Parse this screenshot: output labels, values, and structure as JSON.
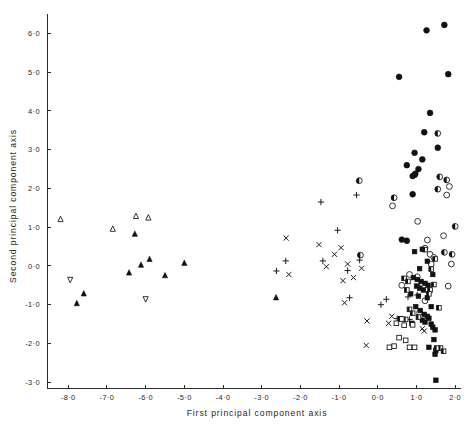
{
  "figure": {
    "title": "",
    "background_color": "#ffffff",
    "ink_color": "#111111"
  },
  "axes": {
    "x_title": "First principal component axis",
    "y_title": "Second principal component axis",
    "x_ticks": [
      "-8·0",
      "-7·0",
      "-6·0",
      "-5·0",
      "-4·0",
      "-3·0",
      "-2·0",
      "-1·0",
      "0·0",
      "1·0",
      "2·0"
    ],
    "y_ticks": [
      "6·0",
      "5·0",
      "4·0",
      "3·0",
      "2·0",
      "1·0",
      "0·0",
      "-1·0",
      "-2·0",
      "-3·0"
    ]
  },
  "chart_data": {
    "type": "scatter",
    "title": "",
    "xlabel": "First principal component axis",
    "ylabel": "Second principal component axis",
    "xlim": [
      -8.55,
      2.15
    ],
    "ylim": [
      -3.15,
      6.45
    ],
    "xticks": [
      -8,
      -7,
      -6,
      -5,
      -4,
      -3,
      -2,
      -1,
      0,
      1,
      2
    ],
    "yticks": [
      6,
      5,
      4,
      3,
      2,
      1,
      0,
      -1,
      -2,
      -3
    ],
    "grid": false,
    "legend_position": "none",
    "series": [
      {
        "name": "open-triangle-up",
        "marker": "triangle-up-open",
        "points": [
          [
            -8.2,
            1.2
          ],
          [
            -6.85,
            0.95
          ],
          [
            -6.25,
            1.28
          ],
          [
            -5.93,
            1.24
          ]
        ]
      },
      {
        "name": "filled-triangle-up",
        "marker": "triangle-up-filled",
        "points": [
          [
            -7.78,
            -0.97
          ],
          [
            -7.6,
            -0.72
          ],
          [
            -6.28,
            0.82
          ],
          [
            -6.43,
            -0.18
          ],
          [
            -6.12,
            0.02
          ],
          [
            -5.9,
            0.17
          ],
          [
            -5.5,
            -0.25
          ],
          [
            -5.0,
            0.07
          ],
          [
            -2.63,
            -0.82
          ]
        ]
      },
      {
        "name": "open-triangle-down",
        "marker": "triangle-down-open",
        "points": [
          [
            -7.95,
            -0.35
          ],
          [
            -6.0,
            -0.85
          ]
        ]
      },
      {
        "name": "plus",
        "marker": "plus",
        "points": [
          [
            -2.62,
            -0.13
          ],
          [
            -2.38,
            0.13
          ],
          [
            -1.47,
            1.65
          ],
          [
            -1.42,
            0.13
          ],
          [
            -1.04,
            0.92
          ],
          [
            -0.78,
            -0.12
          ],
          [
            -0.73,
            -0.82
          ],
          [
            -0.55,
            1.83
          ],
          [
            -0.47,
            0.15
          ],
          [
            0.08,
            -1.0
          ],
          [
            0.22,
            -0.86
          ],
          [
            0.5,
            -1.36
          ],
          [
            0.82,
            -1.38
          ],
          [
            0.78,
            -0.8
          ],
          [
            1.02,
            -0.75
          ],
          [
            1.08,
            -0.52
          ]
        ]
      },
      {
        "name": "cross",
        "marker": "cross",
        "points": [
          [
            -2.37,
            0.72
          ],
          [
            -2.3,
            -0.22
          ],
          [
            -1.52,
            0.55
          ],
          [
            -1.33,
            -0.02
          ],
          [
            -1.12,
            0.3
          ],
          [
            -0.95,
            0.47
          ],
          [
            -0.9,
            -0.38
          ],
          [
            -0.86,
            -0.95
          ],
          [
            -0.78,
            0.05
          ],
          [
            -0.63,
            -0.3
          ],
          [
            -0.42,
            -0.06
          ],
          [
            -0.3,
            -2.05
          ],
          [
            -0.28,
            -1.42
          ],
          [
            0.28,
            -1.48
          ],
          [
            0.36,
            -1.3
          ],
          [
            1.15,
            -1.62
          ],
          [
            1.2,
            -1.68
          ]
        ]
      },
      {
        "name": "filled-circle",
        "marker": "circle-filled",
        "points": [
          [
            1.26,
            6.08
          ],
          [
            1.72,
            6.22
          ],
          [
            0.55,
            4.88
          ],
          [
            1.82,
            4.95
          ],
          [
            1.35,
            3.95
          ],
          [
            1.2,
            3.45
          ],
          [
            1.55,
            3.05
          ],
          [
            0.95,
            2.92
          ],
          [
            0.75,
            2.6
          ],
          [
            1.15,
            2.75
          ],
          [
            1.05,
            2.5
          ],
          [
            0.97,
            2.38
          ],
          [
            0.95,
            2.35
          ],
          [
            0.9,
            1.85
          ],
          [
            0.75,
            0.65
          ],
          [
            0.9,
            2.32
          ],
          [
            0.62,
            0.68
          ]
        ]
      },
      {
        "name": "half-circle",
        "marker": "circle-half",
        "points": [
          [
            -0.48,
            2.2
          ],
          [
            -0.45,
            0.28
          ],
          [
            1.55,
            3.42
          ],
          [
            1.6,
            2.3
          ],
          [
            1.55,
            1.98
          ],
          [
            2.0,
            1.02
          ],
          [
            1.72,
            0.35
          ],
          [
            0.42,
            1.76
          ],
          [
            1.78,
            2.22
          ],
          [
            1.92,
            0.3
          ]
        ]
      },
      {
        "name": "open-circle",
        "marker": "circle-open",
        "points": [
          [
            0.38,
            1.55
          ],
          [
            1.03,
            1.15
          ],
          [
            1.28,
            0.67
          ],
          [
            1.7,
            0.78
          ],
          [
            1.78,
            1.83
          ],
          [
            1.85,
            2.05
          ],
          [
            1.9,
            0.05
          ],
          [
            1.82,
            -0.52
          ],
          [
            1.22,
            0.46
          ],
          [
            1.35,
            0.3
          ],
          [
            1.45,
            0.22
          ],
          [
            1.08,
            -1.2
          ],
          [
            1.22,
            -0.9
          ],
          [
            0.62,
            -0.5
          ],
          [
            0.82,
            -0.22
          ],
          [
            1.02,
            -0.28
          ],
          [
            1.38,
            0.05
          ]
        ]
      },
      {
        "name": "filled-square",
        "marker": "square-filled",
        "points": [
          [
            0.95,
            0.37
          ],
          [
            1.15,
            0.43
          ],
          [
            1.28,
            0.12
          ],
          [
            1.08,
            -0.07
          ],
          [
            0.92,
            -0.3
          ],
          [
            1.02,
            -0.35
          ],
          [
            1.12,
            -0.4
          ],
          [
            1.22,
            -0.45
          ],
          [
            1.3,
            -0.5
          ],
          [
            1.0,
            -0.52
          ],
          [
            1.08,
            -0.58
          ],
          [
            1.18,
            -0.62
          ],
          [
            0.85,
            -0.72
          ],
          [
            1.05,
            -0.78
          ],
          [
            1.28,
            -0.82
          ],
          [
            1.42,
            -0.22
          ],
          [
            0.98,
            -1.05
          ],
          [
            1.1,
            -1.15
          ],
          [
            1.2,
            -1.25
          ],
          [
            1.28,
            -1.3
          ],
          [
            1.32,
            -1.35
          ],
          [
            1.15,
            -1.4
          ],
          [
            1.22,
            -1.45
          ],
          [
            1.38,
            -1.5
          ],
          [
            1.42,
            -1.58
          ],
          [
            1.48,
            -1.65
          ],
          [
            1.45,
            -1.9
          ],
          [
            1.5,
            -2.18
          ],
          [
            1.32,
            -2.1
          ],
          [
            1.48,
            -2.28
          ],
          [
            1.5,
            -2.95
          ],
          [
            0.88,
            -1.48
          ],
          [
            1.38,
            -1.05
          ]
        ]
      },
      {
        "name": "half-square",
        "marker": "square-half",
        "points": [
          [
            1.22,
            0.42
          ],
          [
            1.38,
            -0.08
          ],
          [
            1.48,
            0.18
          ],
          [
            0.68,
            -0.32
          ],
          [
            0.78,
            -0.4
          ],
          [
            0.82,
            -1.12
          ],
          [
            0.9,
            -1.22
          ],
          [
            1.05,
            -1.32
          ],
          [
            1.58,
            -1.08
          ],
          [
            1.62,
            -2.12
          ],
          [
            1.7,
            -2.2
          ],
          [
            0.72,
            -1.38
          ],
          [
            0.58,
            -1.36
          ],
          [
            1.35,
            -0.62
          ],
          [
            1.32,
            -0.72
          ],
          [
            1.45,
            -0.48
          ],
          [
            0.75,
            -0.62
          ],
          [
            1.52,
            -2.12
          ]
        ]
      },
      {
        "name": "open-square",
        "marker": "square-open",
        "points": [
          [
            0.62,
            -1.37
          ],
          [
            0.68,
            -1.53
          ],
          [
            0.55,
            -1.85
          ],
          [
            0.72,
            -1.92
          ],
          [
            0.82,
            -2.1
          ],
          [
            0.95,
            -2.1
          ],
          [
            0.42,
            -2.07
          ],
          [
            0.3,
            -2.1
          ],
          [
            0.48,
            -1.48
          ],
          [
            0.9,
            -1.52
          ]
        ]
      }
    ]
  }
}
